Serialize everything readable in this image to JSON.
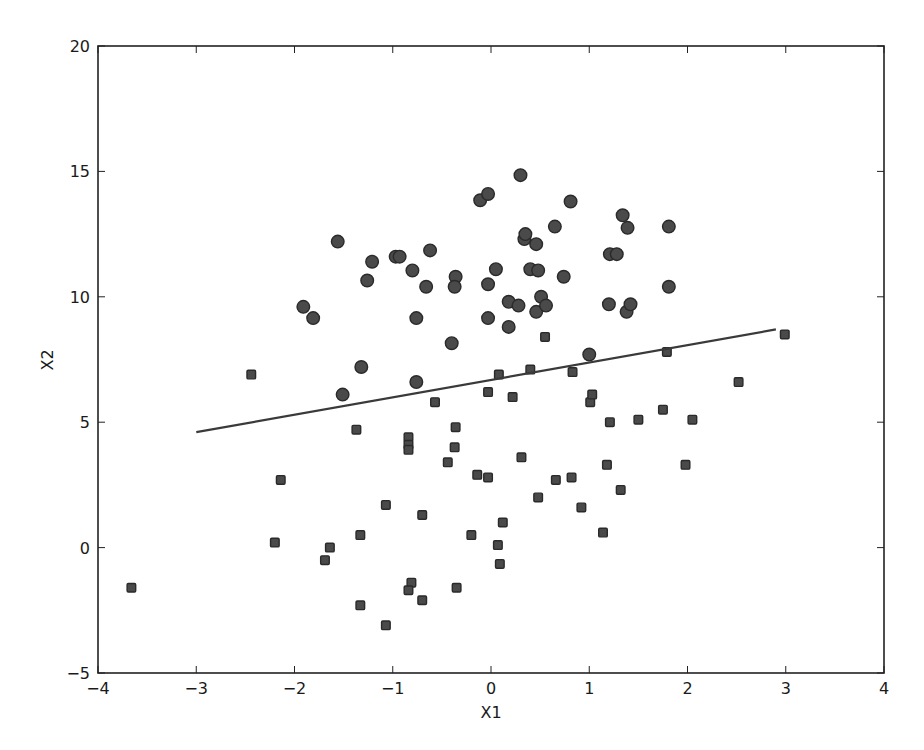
{
  "chart_data": {
    "type": "scatter",
    "title": "",
    "xlabel": "X1",
    "ylabel": "X2",
    "xlim": [
      -4,
      4
    ],
    "ylim": [
      -5,
      20
    ],
    "grid": false,
    "legend": null,
    "xticks": [
      -4,
      -3,
      -2,
      -1,
      0,
      1,
      2,
      3,
      4
    ],
    "yticks": [
      -5,
      0,
      5,
      10,
      15,
      20
    ],
    "xtick_labels": [
      "−4",
      "−3",
      "−2",
      "−1",
      "0",
      "1",
      "2",
      "3",
      "4"
    ],
    "ytick_labels": [
      "−5",
      "0",
      "5",
      "10",
      "15",
      "20"
    ],
    "colors": {
      "marker_fill": "#4a4a4a",
      "marker_edge": "#2a2a2a",
      "line": "#3a3a3a",
      "axes": "#222222"
    },
    "series": [
      {
        "name": "class-circle",
        "marker": "circle",
        "points": [
          [
            -1.56,
            12.2
          ],
          [
            -1.91,
            9.6
          ],
          [
            -1.81,
            9.15
          ],
          [
            -1.21,
            11.4
          ],
          [
            -1.26,
            10.65
          ],
          [
            -0.97,
            11.6
          ],
          [
            -0.93,
            11.6
          ],
          [
            -0.62,
            11.85
          ],
          [
            -0.8,
            11.05
          ],
          [
            -0.66,
            10.4
          ],
          [
            -0.76,
            9.15
          ],
          [
            -1.32,
            7.2
          ],
          [
            -1.51,
            6.1
          ],
          [
            -0.76,
            6.6
          ],
          [
            -0.4,
            8.15
          ],
          [
            -0.36,
            10.8
          ],
          [
            -0.37,
            10.4
          ],
          [
            -0.11,
            13.85
          ],
          [
            -0.03,
            14.1
          ],
          [
            0.05,
            11.1
          ],
          [
            -0.03,
            10.5
          ],
          [
            -0.03,
            9.15
          ],
          [
            0.18,
            9.8
          ],
          [
            0.18,
            8.8
          ],
          [
            0.28,
            9.65
          ],
          [
            0.3,
            14.85
          ],
          [
            0.34,
            12.3
          ],
          [
            0.35,
            12.5
          ],
          [
            0.46,
            12.1
          ],
          [
            0.4,
            11.1
          ],
          [
            0.48,
            11.05
          ],
          [
            0.46,
            9.4
          ],
          [
            0.51,
            10.0
          ],
          [
            0.56,
            9.65
          ],
          [
            0.65,
            12.8
          ],
          [
            0.74,
            10.8
          ],
          [
            0.81,
            13.8
          ],
          [
            1.0,
            7.7
          ],
          [
            1.21,
            11.7
          ],
          [
            1.28,
            11.7
          ],
          [
            1.34,
            13.25
          ],
          [
            1.39,
            12.75
          ],
          [
            1.2,
            9.7
          ],
          [
            1.38,
            9.4
          ],
          [
            1.42,
            9.7
          ],
          [
            1.81,
            12.8
          ],
          [
            1.81,
            10.4
          ]
        ]
      },
      {
        "name": "class-square",
        "marker": "square",
        "points": [
          [
            -3.66,
            -1.6
          ],
          [
            -2.44,
            6.9
          ],
          [
            -2.14,
            2.7
          ],
          [
            -2.2,
            0.2
          ],
          [
            -1.64,
            0.0
          ],
          [
            -1.69,
            -0.5
          ],
          [
            -1.37,
            4.7
          ],
          [
            -1.33,
            0.5
          ],
          [
            -1.33,
            -2.3
          ],
          [
            -1.07,
            1.7
          ],
          [
            -1.07,
            -3.1
          ],
          [
            -0.84,
            4.4
          ],
          [
            -0.84,
            4.1
          ],
          [
            -0.84,
            3.9
          ],
          [
            -0.81,
            -1.4
          ],
          [
            -0.84,
            -1.7
          ],
          [
            -0.7,
            1.3
          ],
          [
            -0.7,
            -2.1
          ],
          [
            -0.57,
            5.8
          ],
          [
            -0.44,
            3.4
          ],
          [
            -0.36,
            4.8
          ],
          [
            -0.37,
            4.0
          ],
          [
            -0.35,
            -1.6
          ],
          [
            -0.2,
            0.5
          ],
          [
            -0.14,
            2.9
          ],
          [
            -0.03,
            6.2
          ],
          [
            -0.03,
            2.8
          ],
          [
            0.08,
            6.9
          ],
          [
            0.07,
            0.1
          ],
          [
            0.09,
            -0.65
          ],
          [
            0.12,
            1.0
          ],
          [
            0.22,
            6.0
          ],
          [
            0.31,
            3.6
          ],
          [
            0.4,
            7.1
          ],
          [
            0.48,
            2.0
          ],
          [
            0.55,
            8.4
          ],
          [
            0.66,
            2.7
          ],
          [
            0.83,
            7.0
          ],
          [
            0.82,
            2.8
          ],
          [
            0.92,
            1.6
          ],
          [
            1.01,
            5.8
          ],
          [
            1.03,
            6.1
          ],
          [
            1.14,
            0.6
          ],
          [
            1.18,
            3.3
          ],
          [
            1.21,
            5.0
          ],
          [
            1.32,
            2.3
          ],
          [
            1.5,
            5.1
          ],
          [
            1.75,
            5.5
          ],
          [
            1.79,
            7.8
          ],
          [
            1.98,
            3.3
          ],
          [
            2.05,
            5.1
          ],
          [
            2.52,
            6.6
          ],
          [
            2.99,
            8.5
          ]
        ]
      },
      {
        "name": "decision-boundary",
        "type": "line",
        "points": [
          [
            -3.0,
            4.6
          ],
          [
            2.9,
            8.7
          ]
        ]
      }
    ]
  }
}
